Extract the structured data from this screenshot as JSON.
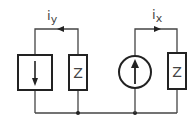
{
  "diagram": {
    "left_branch": {
      "current_label": "i",
      "current_subscript": "y",
      "source_type": "current source (square, arrow down)",
      "impedance_label": "Z"
    },
    "right_branch": {
      "current_label": "i",
      "current_subscript": "x",
      "source_type": "current source (circle, arrow up)",
      "impedance_label": "Z"
    },
    "colors": {
      "wire": "#444444",
      "component": "#222222"
    }
  }
}
